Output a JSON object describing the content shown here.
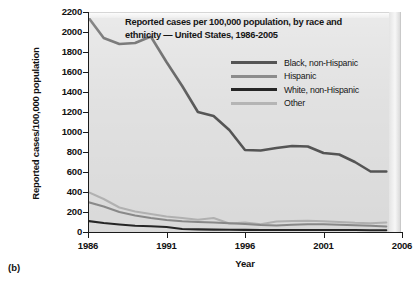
{
  "figure": {
    "panel_label": "(b)",
    "clipped_header_text": ""
  },
  "chart_data": {
    "type": "line",
    "title": "Reported cases per 100,000 population, by race and ethnicity — United States, 1986-2005",
    "title_lines": [
      "Reported cases per 100,000 population, by race and",
      "ethnicity — United States, 1986-2005"
    ],
    "xlabel": "Year",
    "ylabel": "Reported cases/100,000 population",
    "xlim": [
      1986,
      2006
    ],
    "ylim": [
      0,
      2200
    ],
    "xticks": [
      1986,
      1991,
      1996,
      2001,
      2006
    ],
    "yticks": [
      0,
      200,
      400,
      600,
      800,
      1000,
      1200,
      1400,
      1600,
      1800,
      2000,
      2200
    ],
    "grid": false,
    "legend_position": "upper-right-inside",
    "plot_background": "#e0e0e0",
    "x": [
      1986,
      1987,
      1988,
      1989,
      1990,
      1991,
      1992,
      1993,
      1994,
      1995,
      1996,
      1997,
      1998,
      1999,
      2000,
      2001,
      2002,
      2003,
      2004,
      2005
    ],
    "series": [
      {
        "name": "Black, non-Hispanic",
        "color": "#555555",
        "values": [
          2150,
          1940,
          1880,
          1890,
          1955,
          1700,
          1460,
          1200,
          1160,
          1020,
          820,
          815,
          840,
          860,
          855,
          790,
          775,
          700,
          605,
          605
        ]
      },
      {
        "name": "Hispanic",
        "color": "#8c8c8c",
        "values": [
          300,
          255,
          200,
          165,
          140,
          120,
          108,
          100,
          95,
          88,
          80,
          70,
          65,
          72,
          78,
          78,
          72,
          68,
          62,
          55
        ]
      },
      {
        "name": "White, non-Hispanic",
        "color": "#262626",
        "values": [
          110,
          90,
          75,
          62,
          58,
          50,
          30,
          26,
          24,
          22,
          21,
          20,
          20,
          20,
          20,
          20,
          20,
          20,
          18,
          18
        ]
      },
      {
        "name": "Other",
        "color": "#b5b5b5",
        "values": [
          400,
          330,
          245,
          205,
          180,
          155,
          140,
          122,
          140,
          85,
          95,
          78,
          105,
          110,
          112,
          108,
          100,
          92,
          88,
          95
        ]
      }
    ]
  }
}
